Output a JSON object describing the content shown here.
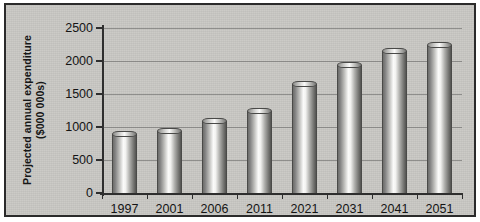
{
  "chart_data": {
    "type": "bar",
    "title": "",
    "subtitle": "",
    "xlabel": "",
    "ylabel": "Projected annual expenditure ($000 000s)",
    "ylabel_line1": "Projected annual expenditure",
    "ylabel_line2": "($000 000s)",
    "categories": [
      "1997",
      "2001",
      "2006",
      "2011",
      "2021",
      "2031",
      "2041",
      "2051"
    ],
    "values": [
      890,
      935,
      1085,
      1240,
      1645,
      1940,
      2155,
      2245
    ],
    "ylim": [
      0,
      2500
    ],
    "yticks": [
      0,
      500,
      1000,
      1500,
      2000,
      2500
    ],
    "ytick_labels": [
      "0",
      "500",
      "1000",
      "1500",
      "2000",
      "2500"
    ],
    "grid": true,
    "legend": false,
    "legend_position": "none",
    "series": [
      {
        "name": "Projected annual expenditure",
        "values": [
          890,
          935,
          1085,
          1240,
          1645,
          1940,
          2155,
          2245
        ]
      }
    ],
    "annotations": []
  },
  "style": {
    "background_color": "#c9c8c4",
    "frame_color": "#2b2b2b",
    "axis_color": "#2e2e2e",
    "gridline_color": "#6a6a6a",
    "text_color": "#141414",
    "bar_highlight_color": "#fbfbfa",
    "bar_shadow_color": "#545452"
  }
}
